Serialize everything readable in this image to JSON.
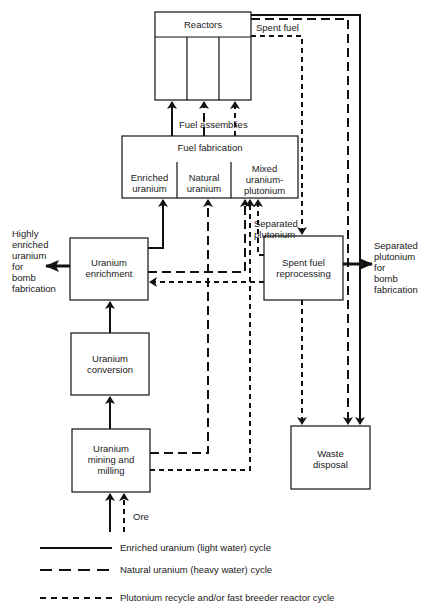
{
  "diagram": {
    "nodes": {
      "reactors": {
        "label": "Reactors"
      },
      "fuel_fabrication": {
        "label": "Fuel fabrication",
        "sections": [
          "Enriched uranium",
          "Natural uranium",
          "Mixed uranium-plutonium"
        ],
        "section_lines": [
          [
            "Enriched",
            "uranium"
          ],
          [
            "Natural",
            "uranium"
          ],
          [
            "Mixed",
            "uranium-",
            "plutonium"
          ]
        ]
      },
      "uranium_enrichment": {
        "lines": [
          "Uranium",
          "enrichment"
        ]
      },
      "uranium_conversion": {
        "lines": [
          "Uranium",
          "conversion"
        ]
      },
      "uranium_mining": {
        "lines": [
          "Uranium",
          "mining and",
          "milling"
        ]
      },
      "spent_fuel_reprocessing": {
        "lines": [
          "Spent fuel",
          "reprocessing"
        ]
      },
      "waste_disposal": {
        "lines": [
          "Waste",
          "disposal"
        ]
      }
    },
    "annotations": {
      "spent_fuel": "Spent fuel",
      "fuel_assemblies": "Fuel assemblies",
      "separated_plutonium": [
        "Separated",
        "plutonium"
      ],
      "heu_output": [
        "Highly",
        "enriched",
        "uranium",
        "for",
        "bomb",
        "fabrication"
      ],
      "pu_output": [
        "Separated",
        "plutonium",
        "for",
        "bomb",
        "fabrication"
      ],
      "ore": "Ore"
    },
    "legend": [
      {
        "style": "solid",
        "label": "Enriched uranium (light water) cycle"
      },
      {
        "style": "long-dash",
        "label": "Natural uranium (heavy water) cycle"
      },
      {
        "style": "short-dash",
        "label": "Plutonium recycle and/or fast breeder reactor cycle"
      }
    ]
  }
}
